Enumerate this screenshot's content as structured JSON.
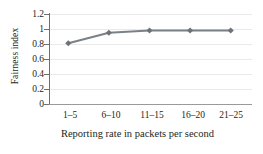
{
  "chart_data": {
    "type": "line",
    "title": "",
    "xlabel": "Reporting rate in packets per second",
    "ylabel": "Fairness index",
    "categories": [
      "1–5",
      "6–10",
      "11–15",
      "16–20",
      "21–25"
    ],
    "values": [
      0.81,
      0.95,
      0.98,
      0.98,
      0.98
    ],
    "series": [
      {
        "name": "Fairness index",
        "values": [
          0.81,
          0.95,
          0.98,
          0.98,
          0.98
        ]
      }
    ],
    "ylim": [
      0,
      1.2
    ],
    "yticks": [
      "0",
      "0.2",
      "0.4",
      "0.6",
      "0.8",
      "1",
      "1.2"
    ],
    "ytick_values": [
      0,
      0.2,
      0.4,
      0.6,
      0.8,
      1,
      1.2
    ],
    "grid": "horizontal",
    "legend": "none",
    "marker": "diamond",
    "colors": {
      "series_line": "#7b8086",
      "marker": "#6e737a",
      "gridline": "#e9e9e9",
      "axis": "#6f6f6f",
      "text": "#231f20",
      "background": "#ffffff"
    }
  }
}
